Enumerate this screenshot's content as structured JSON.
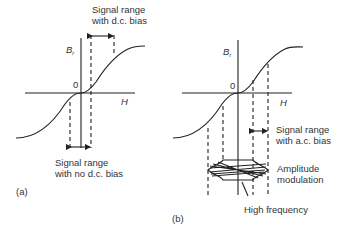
{
  "panel_a": {
    "tag": "(a)",
    "y_axis_label": "B",
    "y_axis_sub": "r",
    "x_axis_label": "H",
    "origin_label": "0",
    "top_annotation": [
      "Signal range",
      "with d.c. bias"
    ],
    "bottom_annotation": [
      "Signal range",
      "with no d.c. bias"
    ]
  },
  "panel_b": {
    "tag": "(b)",
    "y_axis_label": "B",
    "y_axis_sub": "r",
    "x_axis_label": "H",
    "origin_label": "0",
    "signal_annotation": [
      "Signal range",
      "with a.c. bias"
    ],
    "amplitude_annotation": [
      "Amplitude",
      "modulation"
    ],
    "hf_annotation": "High frequency"
  }
}
